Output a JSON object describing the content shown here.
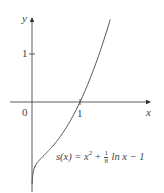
{
  "chart_data": {
    "type": "line",
    "title": "",
    "xlabel": "x",
    "ylabel": "y",
    "origin_label": "0",
    "x_ticks": [
      {
        "value": 1,
        "label": "1"
      }
    ],
    "y_ticks": [
      {
        "value": 1,
        "label": "1"
      }
    ],
    "grid": false,
    "series": [
      {
        "name": "s(x) = x^2 + (1/8) ln x - 1",
        "function": "x^2 + 0.125*ln(x) - 1",
        "x": [
          0.0001,
          0.01,
          0.05,
          0.1,
          0.2,
          0.3,
          0.5,
          0.7,
          1.0,
          1.2,
          1.4,
          1.6,
          1.65
        ],
        "values": [
          -2.15,
          -1.58,
          -1.37,
          -1.28,
          -1.16,
          -1.06,
          -0.84,
          -0.55,
          0.0,
          0.46,
          1.0,
          1.62,
          1.78
        ]
      }
    ],
    "xlim": [
      -0.45,
      2.5
    ],
    "ylim": [
      -1.7,
      1.75
    ],
    "annotation": {
      "lhs": "s(x) = x",
      "exp": "2",
      "plus": " + ",
      "frac_num": "1",
      "frac_den": "8",
      "rhs": " ln x − 1"
    },
    "colors": {
      "axis": "#333333",
      "curve": "#555555",
      "text": "#444444"
    }
  }
}
